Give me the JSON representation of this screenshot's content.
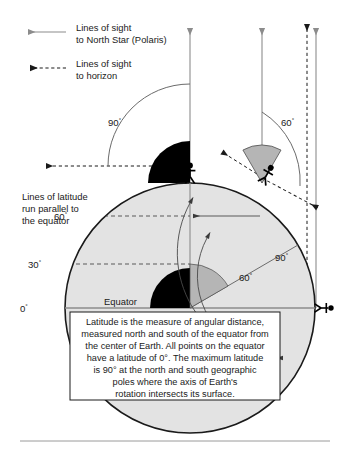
{
  "figure": {
    "title_semantic": "latitude-diagram",
    "legend": {
      "items": [
        {
          "id": "lines-of-sight-polaris",
          "line_style": "solid",
          "color": "#8c8c8c",
          "label_line1": "Lines of sight",
          "label_line2": "to North Star (Polaris)"
        },
        {
          "id": "lines-of-sight-horizon",
          "line_style": "dashed",
          "color": "#1a1a1a",
          "label_line1": "Lines of sight",
          "label_line2": "to horizon"
        }
      ]
    },
    "side_note": {
      "line1": "Lines of latitude",
      "line2": "run parallel to",
      "line3": "the equator"
    },
    "latitude_axis_labels": [
      {
        "id": "lat-60",
        "value": "60",
        "unit": "°"
      },
      {
        "id": "lat-30",
        "value": "30",
        "unit": "°"
      },
      {
        "id": "lat-0",
        "value": "0",
        "unit": "°"
      }
    ],
    "equator_label": "Equator",
    "angle_labels": [
      {
        "id": "sky-angle-pole",
        "value": "90",
        "unit": "°",
        "location": "above-north-pole"
      },
      {
        "id": "sky-angle-60n",
        "value": "60",
        "unit": "°",
        "location": "above-60-north"
      },
      {
        "id": "earth-angle-pole",
        "value": "90",
        "unit": "°",
        "location": "inside-earth-to-pole"
      },
      {
        "id": "earth-angle-60n",
        "value": "60",
        "unit": "°",
        "location": "inside-earth-to-60-north"
      }
    ],
    "observers": [
      {
        "id": "observer-north-pole",
        "latitude": "90°"
      },
      {
        "id": "observer-60-north",
        "latitude": "60°"
      },
      {
        "id": "observer-equator",
        "latitude": "0°"
      }
    ],
    "caption_box": {
      "lines": [
        "Latitude is the measure of angular distance,",
        "measured north and south of the equator from",
        "the center of Earth. All points on the equator",
        "have a latitude of 0°. The maximum latitude",
        "is 90° at the north and south geographic",
        "poles where the axis of Earth's",
        "rotation intersects its surface."
      ]
    },
    "colors": {
      "polaris_line": "#8c8c8c",
      "horizon_line": "#1a1a1a",
      "earth_fill": "#e3e3e3",
      "wedge_black": "#000000",
      "wedge_gray": "#b5b5b5",
      "outline": "#1a1a1a",
      "rule": "#9a9a9a"
    }
  }
}
